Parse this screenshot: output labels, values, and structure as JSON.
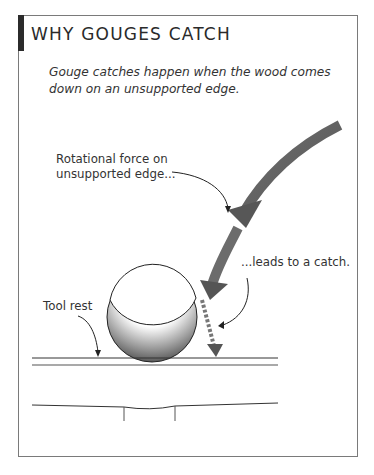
{
  "figure": {
    "title": "WHY GOUGES CATCH",
    "intro": "Gouge catches happen when the wood comes down on an unsupported edge.",
    "labels": {
      "rotational_force_line1": "Rotational force on",
      "rotational_force_line2": "unsupported edge...",
      "leads_to_catch": "...leads to a catch.",
      "tool_rest": "Tool rest"
    },
    "colors": {
      "frame": "#7a7a7a",
      "title_bar": "#2b2b2b",
      "arrow": "#555555",
      "text": "#333333"
    }
  }
}
